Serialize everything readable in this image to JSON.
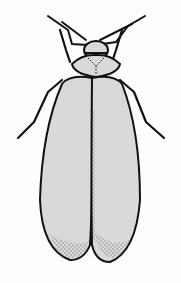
{
  "image": {
    "subject": "beetle illustration",
    "style": "black ink line drawing with light gray fill and stippling",
    "colors": {
      "background": "#fdfdfd",
      "ink": "#111111",
      "fill": "#d9d9d9"
    }
  }
}
